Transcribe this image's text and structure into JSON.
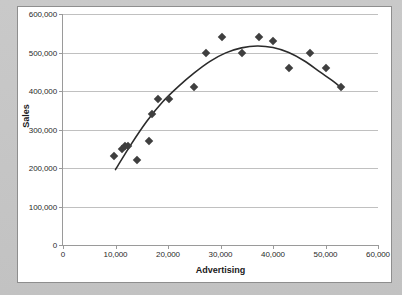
{
  "chart_data": {
    "type": "scatter",
    "title": "",
    "xlabel": "Advertising",
    "ylabel": "Sales",
    "xlim": [
      0,
      60000
    ],
    "ylim": [
      0,
      600000
    ],
    "grid": "horizontal",
    "legend": "none",
    "marker_shape": "diamond",
    "marker_color": "#3f3f3f",
    "trendline_color": "#2b2b2b",
    "trendline_type": "quadratic",
    "x_ticks": [
      0,
      10000,
      20000,
      30000,
      40000,
      50000,
      60000
    ],
    "x_tick_labels": [
      "0",
      "10,000",
      "20,000",
      "30,000",
      "40,000",
      "50,000",
      "60,000"
    ],
    "y_ticks": [
      0,
      100000,
      200000,
      300000,
      400000,
      500000,
      600000
    ],
    "y_tick_labels": [
      "0",
      "100,000",
      "200,000",
      "300,000",
      "400,000",
      "500,000",
      "600,000"
    ],
    "points": [
      {
        "x": 9800,
        "y": 230000
      },
      {
        "x": 11300,
        "y": 250000
      },
      {
        "x": 11900,
        "y": 258000
      },
      {
        "x": 12400,
        "y": 258000
      },
      {
        "x": 14100,
        "y": 220000
      },
      {
        "x": 16400,
        "y": 270000
      },
      {
        "x": 17000,
        "y": 340000
      },
      {
        "x": 18100,
        "y": 380000
      },
      {
        "x": 20100,
        "y": 380000
      },
      {
        "x": 25000,
        "y": 410000
      },
      {
        "x": 27200,
        "y": 500000
      },
      {
        "x": 30200,
        "y": 540000
      },
      {
        "x": 34000,
        "y": 500000
      },
      {
        "x": 37300,
        "y": 540000
      },
      {
        "x": 40000,
        "y": 530000
      },
      {
        "x": 43000,
        "y": 460000
      },
      {
        "x": 47000,
        "y": 500000
      },
      {
        "x": 50000,
        "y": 460000
      },
      {
        "x": 53000,
        "y": 410000
      }
    ],
    "trendline_points": [
      {
        "x": 10000,
        "y": 196000
      },
      {
        "x": 13000,
        "y": 262000
      },
      {
        "x": 16000,
        "y": 322000
      },
      {
        "x": 19000,
        "y": 372000
      },
      {
        "x": 22000,
        "y": 412000
      },
      {
        "x": 25000,
        "y": 447000
      },
      {
        "x": 28000,
        "y": 477000
      },
      {
        "x": 31000,
        "y": 499000
      },
      {
        "x": 34000,
        "y": 512000
      },
      {
        "x": 37000,
        "y": 517000
      },
      {
        "x": 40000,
        "y": 513000
      },
      {
        "x": 43000,
        "y": 500000
      },
      {
        "x": 46000,
        "y": 478000
      },
      {
        "x": 49000,
        "y": 449000
      },
      {
        "x": 51500,
        "y": 425000
      },
      {
        "x": 53200,
        "y": 406000
      }
    ]
  }
}
